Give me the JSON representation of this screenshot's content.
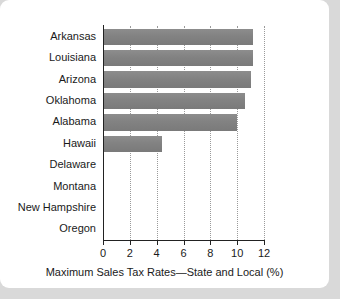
{
  "card": {
    "background_color": "#ffffff",
    "page_background_color": "#d9d9d9"
  },
  "chart_data": {
    "type": "bar",
    "orientation": "horizontal",
    "title": "",
    "xlabel": "Maximum Sales Tax Rates—State and Local (%)",
    "ylabel": "",
    "categories": [
      "Arkansas",
      "Louisiana",
      "Arizona",
      "Oklahoma",
      "Alabama",
      "Hawaii",
      "Delaware",
      "Montana",
      "New Hampshire",
      "Oregon"
    ],
    "values": [
      11.2,
      11.2,
      11.0,
      10.6,
      10.0,
      4.4,
      0,
      0,
      0,
      0
    ],
    "xlim": [
      0,
      12
    ],
    "xticks": [
      0,
      2,
      4,
      6,
      8,
      10,
      12
    ],
    "xticklabels": [
      "0",
      "2",
      "4",
      "6",
      "8",
      "10",
      "12"
    ],
    "grid": "vertical-dotted",
    "legend": "none",
    "bar_color": "#828282",
    "gridline_color": "#9a9a9a",
    "axis_color": "#222222"
  }
}
